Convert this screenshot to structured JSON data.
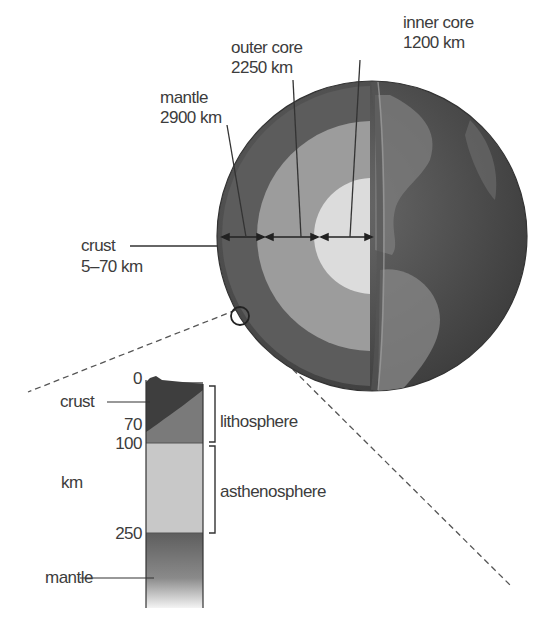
{
  "globe": {
    "labels": {
      "inner_core": {
        "name": "inner core",
        "value": "1200 km"
      },
      "outer_core": {
        "name": "outer core",
        "value": "2250 km"
      },
      "mantle": {
        "name": "mantle",
        "value": "2900 km"
      },
      "crust": {
        "name": "crust",
        "value": "5–70 km"
      }
    },
    "colors": {
      "crust_mantle": "#5a5a5a",
      "outer_core": "#9a9a9a",
      "inner_core": "#dcdcdc",
      "surface": "#4a4a4a",
      "land": "#8a8a8a"
    }
  },
  "column": {
    "depth_ticks": [
      "0",
      "70",
      "100",
      "250"
    ],
    "unit": "km",
    "left_labels": {
      "crust": "crust",
      "mantle": "mantle"
    },
    "brackets": {
      "lithosphere": "lithosphere",
      "asthenosphere": "asthenosphere"
    },
    "colors": {
      "crust": "#3e3e3e",
      "lithosphere_mantle": "#7a7a7a",
      "asthenosphere": "#c8c8c8",
      "mantle": "#6a6a6a"
    }
  }
}
